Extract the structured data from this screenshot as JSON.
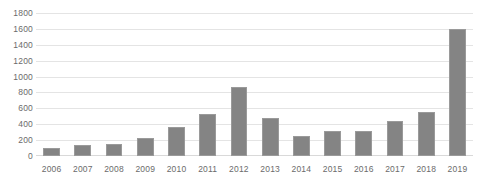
{
  "chart_data": {
    "type": "bar",
    "title": "",
    "subtitle": "",
    "xlabel": "",
    "ylabel": "",
    "categories": [
      "2006",
      "2007",
      "2008",
      "2009",
      "2010",
      "2011",
      "2012",
      "2013",
      "2014",
      "2015",
      "2016",
      "2017",
      "2018",
      "2019"
    ],
    "values": [
      105,
      135,
      155,
      230,
      360,
      530,
      870,
      475,
      255,
      310,
      320,
      445,
      560,
      1600
    ],
    "series": [
      {
        "name": "",
        "values": [
          105,
          135,
          155,
          230,
          360,
          530,
          870,
          475,
          255,
          310,
          320,
          445,
          560,
          1600
        ]
      }
    ],
    "ylim": [
      0,
      1800
    ],
    "y_ticks": [
      1800,
      1600,
      1400,
      1200,
      1000,
      800,
      600,
      400,
      200,
      0
    ],
    "y_tick_labels": [
      "1800",
      "1600",
      "1400",
      "1200",
      "1000",
      "800",
      "600",
      "400",
      "200",
      "0"
    ],
    "grid": true,
    "grid_axis": "y",
    "legend": false,
    "legend_position": "none",
    "annotations": [],
    "colors": {
      "bar_fill": "#848484",
      "bar_border": "#9a9a9a",
      "gridline": "#e4e4e4",
      "tick_label": "#6b6b6b",
      "background": "#ffffff"
    }
  }
}
